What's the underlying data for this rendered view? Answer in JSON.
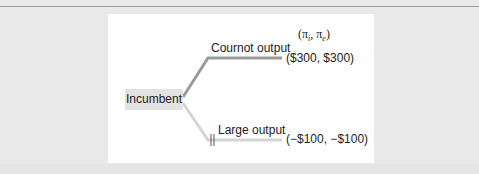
{
  "diagram": {
    "type": "game-tree",
    "root": {
      "label": "Incumbent"
    },
    "payoff_header": "(π_i, π_e)",
    "payoff_header_parts": {
      "pi1": "π",
      "sub1": "i",
      "sep": ", ",
      "pi2": "π",
      "sub2": "e"
    },
    "branches": [
      {
        "label": "Cournot output",
        "payoff": "($300, $300)",
        "color": "#9a9a9a",
        "pruned": false
      },
      {
        "label": "Large output",
        "payoff": "(−$100, −$100)",
        "color": "#d4d4d4",
        "pruned": true
      }
    ]
  },
  "colors": {
    "background": "#e9e9e9",
    "panel": "#ffffff",
    "node_fill": "#e3e3e3",
    "rule": "#9a9a9a"
  }
}
